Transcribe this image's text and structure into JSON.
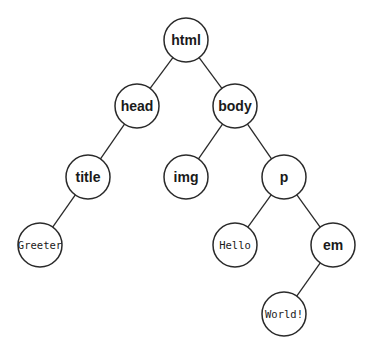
{
  "diagram": {
    "type": "tree",
    "node_radius": 22,
    "nodes": [
      {
        "id": "html",
        "label": "html",
        "kind": "element",
        "x": 186,
        "y": 40
      },
      {
        "id": "head",
        "label": "head",
        "kind": "element",
        "x": 137,
        "y": 106
      },
      {
        "id": "body",
        "label": "body",
        "kind": "element",
        "x": 235,
        "y": 106
      },
      {
        "id": "title",
        "label": "title",
        "kind": "element",
        "x": 88,
        "y": 177
      },
      {
        "id": "img",
        "label": "img",
        "kind": "element",
        "x": 186,
        "y": 177
      },
      {
        "id": "p",
        "label": "p",
        "kind": "element",
        "x": 284,
        "y": 177
      },
      {
        "id": "greeter",
        "label": "Greeter",
        "kind": "text",
        "x": 40,
        "y": 245
      },
      {
        "id": "hello",
        "label": "Hello",
        "kind": "text",
        "x": 235,
        "y": 245
      },
      {
        "id": "em",
        "label": "em",
        "kind": "element",
        "x": 333,
        "y": 245
      },
      {
        "id": "world",
        "label": "World!",
        "kind": "text",
        "x": 284,
        "y": 314
      }
    ],
    "edges": [
      [
        "html",
        "head"
      ],
      [
        "html",
        "body"
      ],
      [
        "head",
        "title"
      ],
      [
        "body",
        "img"
      ],
      [
        "body",
        "p"
      ],
      [
        "title",
        "greeter"
      ],
      [
        "p",
        "hello"
      ],
      [
        "p",
        "em"
      ],
      [
        "em",
        "world"
      ]
    ],
    "colors": {
      "stroke": "#2a2a2a",
      "fill": "#ffffff",
      "text": "#1a1a1a"
    }
  }
}
